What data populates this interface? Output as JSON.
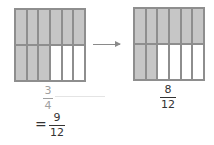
{
  "left_model": {
    "rows": 2,
    "cols": 6,
    "shaded": [
      1,
      1,
      1,
      1,
      1,
      1,
      1,
      1,
      1,
      0,
      0,
      0
    ],
    "fraction": {
      "numerator": "3",
      "denominator": "4"
    }
  },
  "right_model": {
    "rows": 2,
    "cols": 6,
    "shaded": [
      1,
      1,
      1,
      1,
      1,
      1,
      1,
      1,
      0,
      0,
      0,
      0
    ],
    "fraction": {
      "numerator": "8",
      "denominator": "12"
    }
  },
  "equivalence": {
    "symbol": "=",
    "numerator": "9",
    "denominator": "12"
  },
  "colors": {
    "shaded": "#c6c6c6",
    "border": "#8e8e8e",
    "empty": "#ffffff"
  }
}
